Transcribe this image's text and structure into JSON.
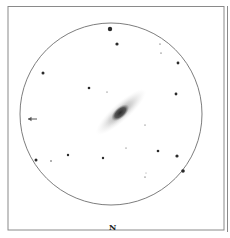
{
  "sketch": {
    "subject": "galaxy-eyepiece-sketch",
    "orientation_label": "N",
    "direction_arrow": "←",
    "colors": {
      "background": "#ffffff",
      "frame": "#8a8a8a",
      "circle": "#6e6e6e",
      "star": "#2a2a2a",
      "galaxy_core": "#3a3a3a",
      "galaxy_halo": "#bdbdbd"
    },
    "field_circle": {
      "cx": 111,
      "cy": 114,
      "r": 91
    },
    "galaxy": {
      "cx": 121,
      "cy": 112,
      "core_rx": 11,
      "core_ry": 6,
      "halo_rx": 33,
      "halo_ry": 9,
      "angle_deg": -42
    },
    "stars": [
      {
        "x": 110,
        "y": 29,
        "r": 2.2
      },
      {
        "x": 117,
        "y": 44,
        "r": 1.6
      },
      {
        "x": 43,
        "y": 73,
        "r": 1.5
      },
      {
        "x": 89,
        "y": 88,
        "r": 1.3
      },
      {
        "x": 107,
        "y": 92,
        "r": 0.5
      },
      {
        "x": 160,
        "y": 44,
        "r": 0.6
      },
      {
        "x": 161,
        "y": 53,
        "r": 0.6
      },
      {
        "x": 178,
        "y": 63,
        "r": 1.4
      },
      {
        "x": 176,
        "y": 94,
        "r": 1.4
      },
      {
        "x": 36,
        "y": 160,
        "r": 1.5
      },
      {
        "x": 51,
        "y": 161,
        "r": 0.7
      },
      {
        "x": 68,
        "y": 155,
        "r": 1.2
      },
      {
        "x": 103,
        "y": 158,
        "r": 1.2
      },
      {
        "x": 158,
        "y": 151,
        "r": 1.3
      },
      {
        "x": 177,
        "y": 156,
        "r": 1.6
      },
      {
        "x": 183,
        "y": 171,
        "r": 1.8
      },
      {
        "x": 145,
        "y": 177,
        "r": 0.6
      },
      {
        "x": 126,
        "y": 148,
        "r": 0.5
      },
      {
        "x": 145,
        "y": 125,
        "r": 0.5
      },
      {
        "x": 146,
        "y": 173,
        "r": 0.4
      }
    ]
  }
}
